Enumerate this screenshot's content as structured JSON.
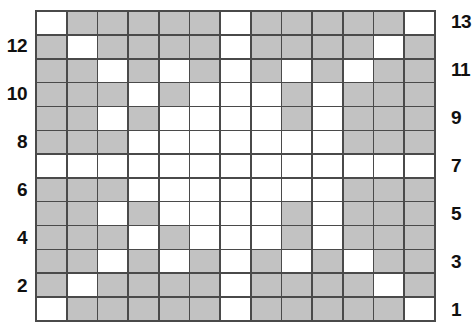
{
  "chart_data": {
    "type": "heatmap",
    "title": "",
    "xlabel": "",
    "ylabel": "",
    "grid": true,
    "rows": 13,
    "columns": 13,
    "legend": [
      {
        "key": "filled",
        "label": "shaded square",
        "color": "#c2c2c2"
      },
      {
        "key": "empty",
        "label": "white square",
        "color": "#ffffff"
      }
    ],
    "colors": {
      "filled": "#c2c2c2",
      "empty": "#ffffff",
      "gridline": "#4a4a4a",
      "border": "#4a4a4a",
      "label": "#101010"
    },
    "row_labels_left": [
      "",
      "12",
      "",
      "10",
      "",
      "8",
      "",
      "6",
      "",
      "4",
      "",
      "2",
      ""
    ],
    "row_labels_right": [
      "13",
      "",
      "11",
      "",
      "9",
      "",
      "7",
      "",
      "5",
      "",
      "3",
      "",
      "1"
    ],
    "row_numbers_top_to_bottom": [
      13,
      12,
      11,
      10,
      9,
      8,
      7,
      6,
      5,
      4,
      3,
      2,
      1
    ],
    "cells": [
      [
        0,
        1,
        1,
        1,
        1,
        1,
        0,
        1,
        1,
        1,
        1,
        1,
        0
      ],
      [
        1,
        0,
        1,
        1,
        1,
        1,
        0,
        1,
        1,
        1,
        1,
        0,
        1
      ],
      [
        1,
        1,
        0,
        1,
        0,
        1,
        0,
        1,
        0,
        1,
        0,
        1,
        1
      ],
      [
        1,
        1,
        1,
        0,
        1,
        0,
        0,
        0,
        1,
        0,
        1,
        1,
        1
      ],
      [
        1,
        1,
        0,
        1,
        0,
        0,
        0,
        0,
        1,
        0,
        1,
        1,
        1
      ],
      [
        1,
        1,
        1,
        0,
        0,
        0,
        0,
        0,
        0,
        0,
        1,
        1,
        1
      ],
      [
        0,
        0,
        0,
        0,
        0,
        0,
        0,
        0,
        0,
        0,
        0,
        0,
        0
      ],
      [
        1,
        1,
        1,
        0,
        0,
        0,
        0,
        0,
        0,
        0,
        1,
        1,
        1
      ],
      [
        1,
        1,
        0,
        1,
        0,
        0,
        0,
        0,
        1,
        0,
        1,
        1,
        1
      ],
      [
        1,
        1,
        1,
        0,
        1,
        0,
        0,
        0,
        1,
        0,
        1,
        1,
        1
      ],
      [
        1,
        1,
        0,
        1,
        0,
        1,
        0,
        1,
        0,
        1,
        0,
        1,
        1
      ],
      [
        1,
        0,
        1,
        1,
        1,
        1,
        0,
        1,
        1,
        1,
        1,
        0,
        1
      ],
      [
        0,
        1,
        1,
        1,
        1,
        1,
        0,
        1,
        1,
        1,
        1,
        1,
        0
      ]
    ]
  }
}
